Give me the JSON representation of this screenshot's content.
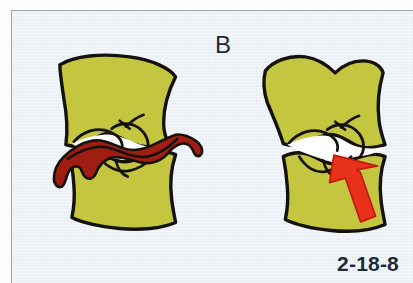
{
  "figure": {
    "panel_label": "B",
    "figure_number": "2-18-8",
    "background_color": "#e9eff4",
    "border_color": "#9aa6ae",
    "bone_fill_color": "#c4c640",
    "outline_color": "#15110c",
    "hemorrhage_color": "#a01d11",
    "arrow_color": "#e8311a",
    "gap_color": "#ffffff"
  },
  "illustration": {
    "type": "medical-line-drawing",
    "subject": "cervical-spine-motion-segment-pair",
    "left_diagram": {
      "name": "vertebral-segment-with-hemorrhage",
      "upper_vertebra": "upper-vertebral-body",
      "lower_vertebra": "lower-vertebral-body",
      "disc_space": "intervertebral-disc-space",
      "hemorrhage": "red-hemorrhage-extravasation"
    },
    "right_diagram": {
      "name": "vertebral-segment-with-arrow",
      "upper_vertebra": "upper-vertebral-body",
      "lower_vertebra": "lower-vertebral-body",
      "disc_space": "intervertebral-disc-space",
      "arrow": "red-pointer-arrow"
    }
  }
}
